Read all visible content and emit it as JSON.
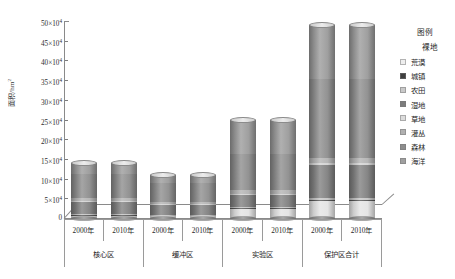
{
  "chart_data": {
    "type": "bar",
    "stacked": true,
    "title": "",
    "xlabel": "",
    "ylabel": "面积/hm²",
    "ylim": [
      0,
      500000
    ],
    "ytick_values": [
      0,
      50000,
      100000,
      150000,
      200000,
      250000,
      300000,
      350000,
      400000,
      450000,
      500000
    ],
    "ytick_labels": [
      "0",
      "5×10",
      "10×10",
      "15×10",
      "20×10",
      "25×10",
      "30×10",
      "35×10",
      "40×10",
      "45×10",
      "50×10"
    ],
    "ytick_exponent": "4",
    "grid": false,
    "legend_position": "right",
    "groups": [
      {
        "name": "核心区",
        "years": [
          "2000年",
          "2010年"
        ]
      },
      {
        "name": "缓冲区",
        "years": [
          "2000年",
          "2010年"
        ]
      },
      {
        "name": "实验区",
        "years": [
          "2000年",
          "2010年"
        ]
      },
      {
        "name": "保护区合计",
        "years": [
          "2000年",
          "2010年"
        ]
      }
    ],
    "categories": [
      "核心区 2000年",
      "核心区 2010年",
      "缓冲区 2000年",
      "缓冲区 2010年",
      "实验区 2000年",
      "实验区 2010年",
      "保护区合计 2000年",
      "保护区合计 2010年"
    ],
    "totals": [
      140000,
      140000,
      110000,
      110000,
      250000,
      250000,
      490000,
      490000
    ],
    "series": [
      {
        "name": "海洋",
        "color": "#9a9a9a",
        "values": [
          28000,
          28000,
          22000,
          22000,
          88000,
          88000,
          138000,
          138000
        ]
      },
      {
        "name": "森林",
        "color": "#8c8c8c",
        "values": [
          62000,
          62000,
          48000,
          48000,
          92000,
          92000,
          200000,
          200000
        ]
      },
      {
        "name": "灌丛",
        "color": "#b2b2b2",
        "values": [
          6000,
          6000,
          5000,
          5000,
          8000,
          8000,
          12000,
          12000
        ]
      },
      {
        "name": "草地",
        "color": "#d2d2d2",
        "values": [
          4000,
          4000,
          3000,
          3000,
          4000,
          4000,
          6000,
          6000
        ]
      },
      {
        "name": "湿地",
        "color": "#7f7f7f",
        "values": [
          30000,
          30000,
          24000,
          24000,
          30000,
          30000,
          84000,
          84000
        ]
      },
      {
        "name": "农田",
        "color": "#c4c4c4",
        "values": [
          3000,
          3000,
          2000,
          2000,
          3000,
          3000,
          5000,
          5000
        ]
      },
      {
        "name": "城镇",
        "color": "#555555",
        "values": [
          2000,
          2000,
          1000,
          1000,
          2000,
          2000,
          3000,
          3000
        ]
      },
      {
        "name": "荒漠",
        "color": "#e4e4e4",
        "values": [
          5000,
          5000,
          5000,
          5000,
          23000,
          23000,
          42000,
          42000
        ]
      }
    ]
  },
  "legend": {
    "title": "图例",
    "first_entry": "裸地",
    "items": [
      {
        "label": "荒漠",
        "color": "#eeeeee"
      },
      {
        "label": "城镇",
        "color": "#3f3f3f"
      },
      {
        "label": "农田",
        "color": "#c9c9c9"
      },
      {
        "label": "湿地",
        "color": "#7c7c7c"
      },
      {
        "label": "草地",
        "color": "#dcdcdc"
      },
      {
        "label": "灌丛",
        "color": "#b0b0b0"
      },
      {
        "label": "森林",
        "color": "#8d8d8d"
      },
      {
        "label": "海洋",
        "color": "#9f9f9f"
      }
    ]
  },
  "axis": {
    "y_title": "面积/hm²",
    "y_title_sup": "2"
  }
}
